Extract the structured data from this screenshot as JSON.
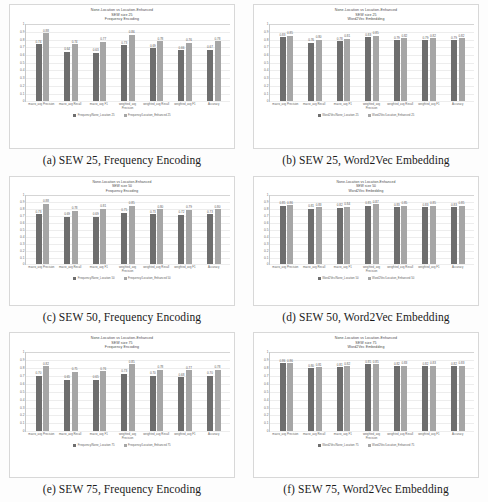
{
  "figure": {
    "panel_count": 6,
    "series_colors": {
      "none_location": "#6e6e6e",
      "location_enhanced": "#a6a6a6"
    },
    "axis": {
      "yticks": [
        "1",
        "0.9",
        "0.8",
        "0.7",
        "0.6",
        "0.5",
        "0.4",
        "0.3",
        "0.2",
        "0.1",
        "0"
      ],
      "ylim": [
        0,
        1
      ]
    },
    "categories": [
      "macro_avg Precision",
      "macro_avg Recall",
      "macro_avg F1",
      "weighted_avg Precision",
      "weighted_avg Recall",
      "weighted_avg F1",
      "Accuracy"
    ]
  },
  "panels": [
    {
      "caption": "(a) SEW 25, Frequency Encoding",
      "title_line1": "None-Location vs Location-Enhanced",
      "title_line2": "SEW size 25",
      "title_line3": "Frequency Encoding",
      "legend": [
        "Frequency/None_Location 25",
        "Frequency/Location_Enhanced 25"
      ],
      "chart_data": {
        "type": "bar",
        "title": "None-Location vs Location-Enhanced SEW size 25 Frequency Encoding",
        "xlabel": "",
        "ylabel": "",
        "ylim": [
          0,
          1
        ],
        "grid": true,
        "legend_position": "bottom",
        "categories": [
          "macro_avg Precision",
          "macro_avg Recall",
          "macro_avg F1",
          "weighted_avg Precision",
          "weighted_avg Recall",
          "weighted_avg F1",
          "Accuracy"
        ],
        "series": [
          {
            "name": "Frequency/None_Location 25",
            "values": [
              0.74,
              0.64,
              0.63,
              0.73,
              0.69,
              0.66,
              0.67
            ]
          },
          {
            "name": "Frequency/Location_Enhanced 25",
            "values": [
              0.88,
              0.74,
              0.77,
              0.86,
              0.78,
              0.76,
              0.78
            ]
          }
        ]
      }
    },
    {
      "caption": "(b) SEW 25, Word2Vec Embedding",
      "title_line1": "None-Location vs Location-Enhanced",
      "title_line2": "SEW size 25",
      "title_line3": "Word2Vec Embedding",
      "legend": [
        "Word2Vec/None_Location 25",
        "Word2Vec/Location_Enhanced 25"
      ],
      "chart_data": {
        "type": "bar",
        "title": "None-Location vs Location-Enhanced SEW size 25 Word2Vec Embedding",
        "xlabel": "",
        "ylabel": "",
        "ylim": [
          0,
          1
        ],
        "grid": true,
        "legend_position": "bottom",
        "categories": [
          "macro_avg Precision",
          "macro_avg Recall",
          "macro_avg F1",
          "weighted_avg Precision",
          "weighted_avg Recall",
          "weighted_avg F1",
          "Accuracy"
        ],
        "series": [
          {
            "name": "Word2Vec/None_Location 25",
            "values": [
              0.83,
              0.76,
              0.78,
              0.83,
              0.79,
              0.79,
              0.79
            ]
          },
          {
            "name": "Word2Vec/Location_Enhanced 25",
            "values": [
              0.85,
              0.8,
              0.81,
              0.85,
              0.82,
              0.82,
              0.82
            ]
          }
        ]
      }
    },
    {
      "caption": "(c) SEW 50, Frequency Encoding",
      "title_line1": "None-Location vs Location-Enhanced",
      "title_line2": "SEW size 50",
      "title_line3": "Frequency Encoding",
      "legend": [
        "Frequency/None_Location 50",
        "Frequency/Location_Enhanced 50"
      ],
      "chart_data": {
        "type": "bar",
        "title": "None-Location vs Location-Enhanced SEW size 50 Frequency Encoding",
        "xlabel": "",
        "ylabel": "",
        "ylim": [
          0,
          1
        ],
        "grid": true,
        "legend_position": "bottom",
        "categories": [
          "macro_avg Precision",
          "macro_avg Recall",
          "macro_avg F1",
          "weighted_avg Precision",
          "weighted_avg Recall",
          "weighted_avg F1",
          "Accuracy"
        ],
        "series": [
          {
            "name": "Frequency/None_Location 50",
            "values": [
              0.73,
              0.69,
              0.69,
              0.75,
              0.73,
              0.72,
              0.73
            ]
          },
          {
            "name": "Frequency/Location_Enhanced 50",
            "values": [
              0.88,
              0.78,
              0.81,
              0.85,
              0.8,
              0.79,
              0.8
            ]
          }
        ]
      }
    },
    {
      "caption": "(d) SEW 50, Word2Vec Embedding",
      "title_line1": "None-Location vs Location-Enhanced",
      "title_line2": "SEW size 50",
      "title_line3": "Word2Vec Embedding",
      "legend": [
        "Word2Vec/None_Location 50",
        "Word2Vec/Location_Enhanced 50"
      ],
      "chart_data": {
        "type": "bar",
        "title": "None-Location vs Location-Enhanced SEW size 50 Word2Vec Embedding",
        "xlabel": "",
        "ylabel": "",
        "ylim": [
          0,
          1
        ],
        "grid": true,
        "legend_position": "bottom",
        "categories": [
          "macro_avg Precision",
          "macro_avg Recall",
          "macro_avg F1",
          "weighted_avg Precision",
          "weighted_avg Recall",
          "weighted_avg F1",
          "Accuracy"
        ],
        "series": [
          {
            "name": "Word2Vec/None_Location 50",
            "values": [
              0.85,
              0.81,
              0.82,
              0.85,
              0.83,
              0.83,
              0.83
            ]
          },
          {
            "name": "Word2Vec/Location_Enhanced 50",
            "values": [
              0.86,
              0.83,
              0.84,
              0.87,
              0.85,
              0.85,
              0.85
            ]
          }
        ]
      }
    },
    {
      "caption": "(e) SEW 75, Frequency Encoding",
      "title_line1": "None-Location vs Location-Enhanced",
      "title_line2": "SEW size 75",
      "title_line3": "Frequency Encoding",
      "legend": [
        "Frequency/None_Location 75",
        "Frequency/Location_Enhanced 75"
      ],
      "chart_data": {
        "type": "bar",
        "title": "None-Location vs Location-Enhanced SEW size 75 Frequency Encoding",
        "xlabel": "",
        "ylabel": "",
        "ylim": [
          0,
          1
        ],
        "grid": true,
        "legend_position": "bottom",
        "categories": [
          "macro_avg Precision",
          "macro_avg Recall",
          "macro_avg F1",
          "weighted_avg Precision",
          "weighted_avg Recall",
          "weighted_avg F1",
          "Accuracy"
        ],
        "series": [
          {
            "name": "Frequency/None_Location 75",
            "values": [
              0.7,
              0.65,
              0.65,
              0.73,
              0.7,
              0.68,
              0.7
            ]
          },
          {
            "name": "Frequency/Location_Enhanced 75",
            "values": [
              0.82,
              0.75,
              0.76,
              0.85,
              0.78,
              0.77,
              0.78
            ]
          }
        ]
      }
    },
    {
      "caption": "(f) SEW 75, Word2Vec Embedding",
      "title_line1": "None-Location vs Location-Enhanced",
      "title_line2": "SEW size 75",
      "title_line3": "Word2Vec Embedding",
      "legend": [
        "Word2Vec/None_Location 75",
        "Word2Vec/Location_Enhanced 75"
      ],
      "chart_data": {
        "type": "bar",
        "title": "None-Location vs Location-Enhanced SEW size 75 Word2Vec Embedding",
        "xlabel": "",
        "ylabel": "",
        "ylim": [
          0,
          1
        ],
        "grid": true,
        "legend_position": "bottom",
        "categories": [
          "macro_avg Precision",
          "macro_avg Recall",
          "macro_avg F1",
          "weighted_avg Precision",
          "weighted_avg Recall",
          "weighted_avg F1",
          "Accuracy"
        ],
        "series": [
          {
            "name": "Word2Vec/None_Location 75",
            "values": [
              0.86,
              0.8,
              0.81,
              0.85,
              0.82,
              0.82,
              0.82
            ]
          },
          {
            "name": "Word2Vec/Location_Enhanced 75",
            "values": [
              0.86,
              0.81,
              0.82,
              0.85,
              0.83,
              0.83,
              0.83
            ]
          }
        ]
      }
    }
  ]
}
